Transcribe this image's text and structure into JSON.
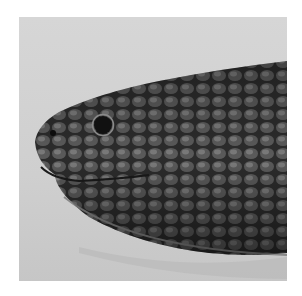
{
  "image": {
    "subject": "snake head close-up, side view",
    "background_color": "#d2d2d2",
    "scale_color": "#3a3a3a",
    "shadow_color": "#1e1e1e"
  }
}
